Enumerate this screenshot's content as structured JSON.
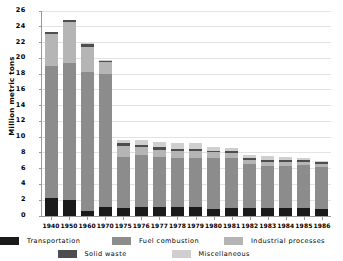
{
  "chart_data": {
    "type": "bar",
    "stacked": true,
    "title": "by source, 1940-1986",
    "xlabel": "",
    "ylabel": "Million metric tons",
    "ylim": [
      0,
      26
    ],
    "ytick_step": 2,
    "yticks": [
      0,
      2,
      4,
      6,
      8,
      10,
      12,
      14,
      16,
      18,
      20,
      22,
      24,
      26
    ],
    "grid": true,
    "legend_position": "bottom",
    "categories": [
      "1940",
      "1950",
      "1960",
      "1970",
      "1975",
      "1976",
      "1977",
      "1978",
      "1979",
      "1980",
      "1981",
      "1982",
      "1983",
      "1984",
      "1985",
      "1986"
    ],
    "series": [
      {
        "name": "Transportation",
        "color": "#1a1a1a",
        "values": [
          2.3,
          2.0,
          0.6,
          1.1,
          1.0,
          1.1,
          1.1,
          1.1,
          1.1,
          0.9,
          1.0,
          1.0,
          1.0,
          1.0,
          1.0,
          0.9
        ]
      },
      {
        "name": "Fuel combustion",
        "color": "#8c8c8c",
        "values": [
          16.7,
          17.4,
          17.7,
          16.9,
          6.5,
          6.6,
          6.4,
          6.3,
          6.3,
          6.4,
          6.3,
          5.6,
          5.4,
          5.4,
          5.5,
          5.3
        ]
      },
      {
        "name": "Industrial processes",
        "color": "#b5b5b5",
        "values": [
          4.1,
          5.2,
          3.2,
          1.5,
          1.4,
          1.0,
          0.9,
          0.8,
          0.8,
          0.8,
          0.7,
          0.5,
          0.5,
          0.5,
          0.4,
          0.4
        ]
      },
      {
        "name": "Solid waste",
        "color": "#4d4d4d",
        "values": [
          0.3,
          0.3,
          0.3,
          0.2,
          0.3,
          0.3,
          0.3,
          0.3,
          0.3,
          0.2,
          0.2,
          0.2,
          0.2,
          0.2,
          0.2,
          0.2
        ]
      },
      {
        "name": "Miscellaneous",
        "color": "#cfcfcf",
        "values": [
          0.0,
          0.0,
          0.1,
          0.1,
          0.5,
          0.6,
          0.7,
          0.7,
          0.7,
          0.5,
          0.4,
          0.4,
          0.5,
          0.4,
          0.3,
          0.2
        ]
      }
    ],
    "totals": [
      23.4,
      24.9,
      21.9,
      19.8,
      9.7,
      9.6,
      9.4,
      9.2,
      9.2,
      8.8,
      8.6,
      7.7,
      7.6,
      7.5,
      7.4,
      7.0
    ]
  },
  "colors": {
    "axis": "#9a9a9a",
    "grid": "#e2e2e2",
    "background": "#ffffff",
    "text": "#000000"
  }
}
